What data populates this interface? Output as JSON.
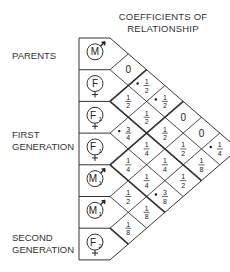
{
  "title": {
    "line1": "COEFFICIENTS OF",
    "line2": "RELATIONSHIP"
  },
  "generation_labels": [
    {
      "id": "parents",
      "lines": [
        "PARENTS"
      ]
    },
    {
      "id": "first",
      "lines": [
        "FIRST",
        "GENERATION"
      ]
    },
    {
      "id": "second",
      "lines": [
        "SECOND",
        "GENERATION"
      ]
    }
  ],
  "individuals": [
    {
      "label": "M",
      "sub": "",
      "sex": "male"
    },
    {
      "label": "F",
      "sub": "",
      "sex": "female"
    },
    {
      "label": "F",
      "sub": "1",
      "sex": "female"
    },
    {
      "label": "F",
      "sub": "1",
      "sex": "female"
    },
    {
      "label": "M",
      "sub": "1",
      "sex": "male"
    },
    {
      "label": "M",
      "sub": "1",
      "sex": "male"
    },
    {
      "label": "F",
      "sub": "2",
      "sex": "female"
    }
  ],
  "coefficients": [
    {
      "i": 0,
      "j": 1,
      "value": "0",
      "mark": false
    },
    {
      "i": 1,
      "j": 2,
      "value": "1/2",
      "mark": false
    },
    {
      "i": 2,
      "j": 3,
      "value": "3/4",
      "mark": true
    },
    {
      "i": 3,
      "j": 4,
      "value": "1/4",
      "mark": false
    },
    {
      "i": 4,
      "j": 5,
      "value": "1/2",
      "mark": false
    },
    {
      "i": 5,
      "j": 6,
      "value": "1/8",
      "mark": false
    },
    {
      "i": 0,
      "j": 2,
      "value": "1/2",
      "mark": true
    },
    {
      "i": 1,
      "j": 3,
      "value": "1/2",
      "mark": false
    },
    {
      "i": 2,
      "j": 4,
      "value": "1/4",
      "mark": false
    },
    {
      "i": 3,
      "j": 5,
      "value": "1/4",
      "mark": false
    },
    {
      "i": 4,
      "j": 6,
      "value": "1/8",
      "mark": false
    },
    {
      "i": 0,
      "j": 3,
      "value": "1/2",
      "mark": true
    },
    {
      "i": 1,
      "j": 4,
      "value": "1/2",
      "mark": false
    },
    {
      "i": 2,
      "j": 5,
      "value": "1/4",
      "mark": false
    },
    {
      "i": 3,
      "j": 6,
      "value": "3/8",
      "mark": true
    },
    {
      "i": 0,
      "j": 4,
      "value": "0",
      "mark": false
    },
    {
      "i": 1,
      "j": 5,
      "value": "1/2",
      "mark": false
    },
    {
      "i": 2,
      "j": 6,
      "value": "1/2",
      "mark": false
    },
    {
      "i": 0,
      "j": 5,
      "value": "0",
      "mark": false
    },
    {
      "i": 1,
      "j": 6,
      "value": "1/8",
      "mark": false
    },
    {
      "i": 0,
      "j": 6,
      "value": "1/4",
      "mark": true
    }
  ]
}
